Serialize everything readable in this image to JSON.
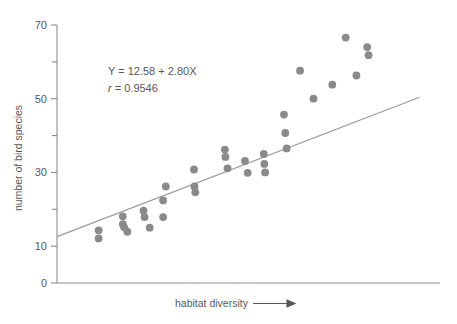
{
  "chart_data": {
    "type": "scatter",
    "title": "",
    "xlabel": "habitat diversity",
    "ylabel": "number of bird species",
    "xlabel_suffix_icon": "right-arrow",
    "xlim": [
      0,
      14
    ],
    "ylim": [
      0,
      70
    ],
    "grid": false,
    "legend": null,
    "y_ticks_major": [
      0,
      10,
      30,
      50,
      70
    ],
    "y_ticks_minor": [
      20,
      40,
      60
    ],
    "y_tick_labels": [
      "0",
      "10",
      "30",
      "50",
      "70"
    ],
    "x_ticks": [],
    "x_tick_labels": [],
    "point_color": "#8a8a8a",
    "line_color": "#9a9a9a",
    "axis_color": "#8c8c8c",
    "text_color": "#58585a",
    "annotations": [
      {
        "id": "regression-equation",
        "text": "Y = 12.58 + 2.80X"
      },
      {
        "id": "correlation-coefficient",
        "text": "r = 0.9546",
        "italic_prefix": "r",
        "rest": " = 0.9546"
      }
    ],
    "regression": {
      "intercept": 12.58,
      "slope": 2.8,
      "r": 0.9546,
      "x_start": 0.0,
      "x_end": 13.5
    },
    "points": [
      {
        "x": 1.55,
        "y": 14.3
      },
      {
        "x": 1.55,
        "y": 12.1
      },
      {
        "x": 2.45,
        "y": 18.1
      },
      {
        "x": 2.45,
        "y": 16.0
      },
      {
        "x": 2.5,
        "y": 15.1
      },
      {
        "x": 2.62,
        "y": 13.9
      },
      {
        "x": 3.22,
        "y": 19.6
      },
      {
        "x": 3.26,
        "y": 17.9
      },
      {
        "x": 3.45,
        "y": 15.0
      },
      {
        "x": 3.95,
        "y": 22.4
      },
      {
        "x": 3.95,
        "y": 17.9
      },
      {
        "x": 4.05,
        "y": 26.2
      },
      {
        "x": 5.1,
        "y": 30.8
      },
      {
        "x": 5.12,
        "y": 26.2
      },
      {
        "x": 5.15,
        "y": 24.6
      },
      {
        "x": 6.25,
        "y": 36.2
      },
      {
        "x": 6.27,
        "y": 34.2
      },
      {
        "x": 6.35,
        "y": 31.1
      },
      {
        "x": 7.0,
        "y": 33.1
      },
      {
        "x": 7.1,
        "y": 29.9
      },
      {
        "x": 7.7,
        "y": 35.0
      },
      {
        "x": 7.72,
        "y": 32.3
      },
      {
        "x": 7.75,
        "y": 30.0
      },
      {
        "x": 8.45,
        "y": 45.7
      },
      {
        "x": 8.5,
        "y": 40.7
      },
      {
        "x": 8.55,
        "y": 36.5
      },
      {
        "x": 9.05,
        "y": 57.6
      },
      {
        "x": 9.55,
        "y": 50.0
      },
      {
        "x": 10.25,
        "y": 53.8
      },
      {
        "x": 10.75,
        "y": 66.6
      },
      {
        "x": 11.15,
        "y": 56.3
      },
      {
        "x": 11.55,
        "y": 64.0
      },
      {
        "x": 11.6,
        "y": 61.8
      }
    ]
  }
}
